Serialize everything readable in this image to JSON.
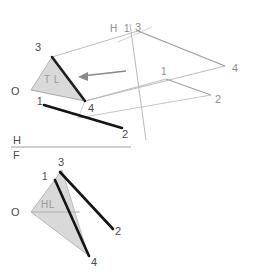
{
  "figure": {
    "background_color": "#ffffff",
    "ink_color_bold": "#1a1a1a",
    "ink_color_light": "#a9a9a9",
    "shade_fill": "#d9d9d9",
    "shade_stroke": "#b0b0b0",
    "label_color": "#4a4a4a"
  },
  "upper_view": {
    "name": "auxiliary-view-1",
    "triangle": {
      "name": "true-length-triangle",
      "fill": "#d9d9d9",
      "vertices": [
        {
          "id": "3",
          "label": "3",
          "x": 52,
          "y": 57
        },
        {
          "id": "O",
          "label": "O",
          "x": 31,
          "y": 90
        },
        {
          "id": "4",
          "label": "4",
          "x": 85,
          "y": 101
        }
      ],
      "inner_label": "T L"
    },
    "labels": {
      "vertex_3": "3",
      "vertex_O": "O",
      "vertex_4": "4",
      "inner": "T L",
      "fold_h": "H",
      "fold_1": "1",
      "plane_3": "3",
      "plane_4": "4",
      "plane_1": "1",
      "plane_2": "2",
      "lower_1": "1",
      "lower_2": "2"
    },
    "arrow": {
      "name": "view-direction-arrow",
      "from_x": 126,
      "from_y": 71,
      "to_x": 78,
      "to_y": 77
    },
    "fold_line": {
      "name": "h-1-fold-line",
      "label_left": "H",
      "label_right": "1"
    }
  },
  "divider": {
    "name": "h-f-fold-line",
    "label_top": "H",
    "label_bottom": "F"
  },
  "lower_view": {
    "name": "front-view",
    "triangle": {
      "name": "horizontal-line-triangle",
      "fill": "#d9d9d9",
      "vertices": [
        {
          "id": "3",
          "label": "3",
          "x": 62,
          "y": 170
        },
        {
          "id": "O",
          "label": "O",
          "x": 31,
          "y": 212
        },
        {
          "id": "4",
          "label": "4",
          "x": 88,
          "y": 255
        }
      ],
      "inner_label": "HL"
    },
    "labels": {
      "vertex_3": "3",
      "vertex_O": "O",
      "vertex_4": "4",
      "vertex_1": "1",
      "vertex_2": "2",
      "inner": "HL"
    }
  }
}
